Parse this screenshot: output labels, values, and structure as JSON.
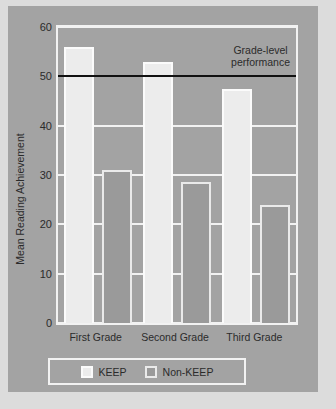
{
  "chart_data": {
    "type": "bar",
    "title": "",
    "xlabel": "",
    "ylabel": "Mean Reading Achievement",
    "categories": [
      "First Grade",
      "Second Grade",
      "Third Grade"
    ],
    "series": [
      {
        "name": "KEEP",
        "values": [
          56,
          53,
          47.5
        ],
        "color": "#ececec"
      },
      {
        "name": "Non-KEEP",
        "values": [
          31,
          28.5,
          24
        ],
        "color": "#9a9a9a"
      }
    ],
    "ylim": [
      0,
      60
    ],
    "yticks": [
      0,
      10,
      20,
      30,
      40,
      50,
      60
    ],
    "grid": true,
    "legend_position": "bottom",
    "annotations": [
      {
        "name": "grade-level-performance",
        "text_line1": "Grade-level",
        "text_line2": "performance",
        "value": 50,
        "type": "horizontal-reference-line",
        "color": "#111111"
      }
    ]
  },
  "colors": {
    "panel_background": "#a3a3a3",
    "page_background": "#dcdcdc",
    "gridline": "#f2f2f2",
    "axis_text": "#2b2b2b",
    "reference_line": "#111111"
  }
}
